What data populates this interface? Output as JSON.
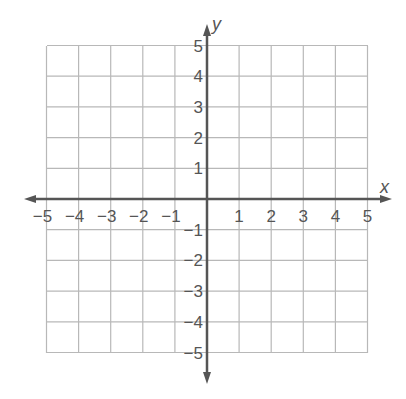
{
  "chart_data": {
    "type": "coordinate-grid",
    "title": "",
    "xlabel": "x",
    "ylabel": "y",
    "xlim": [
      -5,
      5
    ],
    "ylim": [
      -5,
      5
    ],
    "grid": true,
    "x_ticks": [
      -5,
      -4,
      -3,
      -2,
      -1,
      1,
      2,
      3,
      4,
      5
    ],
    "y_ticks": [
      5,
      4,
      3,
      2,
      1,
      -1,
      -2,
      -3,
      -4,
      -5
    ],
    "x_tick_labels": [
      "−5",
      "−4",
      "−3",
      "−2",
      "−1",
      "1",
      "2",
      "3",
      "4",
      "5"
    ],
    "y_tick_labels": [
      "5",
      "4",
      "3",
      "2",
      "1",
      "−1",
      "−2",
      "−3",
      "−4",
      "−5"
    ],
    "series": [],
    "legend": null
  },
  "colors": {
    "grid": "#b8b8b8",
    "axis": "#555555",
    "text": "#555555"
  }
}
